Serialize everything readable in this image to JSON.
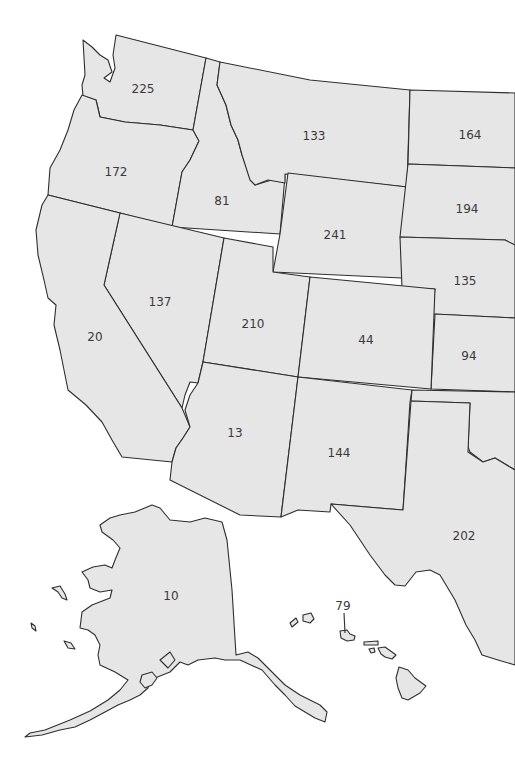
{
  "map": {
    "title": "",
    "fill_color": "#e6e6e6",
    "stroke_color": "#2e2e2e",
    "background": "#ffffff",
    "regions": [
      {
        "id": "WA",
        "name": "Washington",
        "value": "225"
      },
      {
        "id": "OR",
        "name": "Oregon",
        "value": "172"
      },
      {
        "id": "ID",
        "name": "Idaho",
        "value": "81"
      },
      {
        "id": "MT",
        "name": "Montana",
        "value": "133"
      },
      {
        "id": "WY",
        "name": "Wyoming",
        "value": "241"
      },
      {
        "id": "ND",
        "name": "North Dakota",
        "value": "164"
      },
      {
        "id": "SD",
        "name": "South Dakota",
        "value": "194"
      },
      {
        "id": "NE",
        "name": "Nebraska",
        "value": "135"
      },
      {
        "id": "KS",
        "name": "Kansas",
        "value": "94"
      },
      {
        "id": "CA",
        "name": "California",
        "value": "20"
      },
      {
        "id": "NV",
        "name": "Nevada",
        "value": "137"
      },
      {
        "id": "UT",
        "name": "Utah",
        "value": "210"
      },
      {
        "id": "CO",
        "name": "Colorado",
        "value": "44"
      },
      {
        "id": "AZ",
        "name": "Arizona",
        "value": "13"
      },
      {
        "id": "NM",
        "name": "New Mexico",
        "value": "144"
      },
      {
        "id": "TX",
        "name": "Texas",
        "value": "202"
      },
      {
        "id": "OK",
        "name": "Oklahoma",
        "value": ""
      },
      {
        "id": "AK",
        "name": "Alaska",
        "value": "10"
      },
      {
        "id": "HI",
        "name": "Hawaii",
        "value": "79"
      }
    ]
  }
}
